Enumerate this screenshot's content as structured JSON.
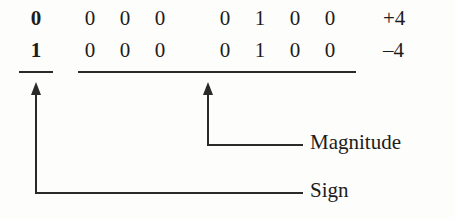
{
  "figure": {
    "rows": [
      {
        "name": "positive-row",
        "sign_bit": "0",
        "magnitude_bits": [
          "0",
          "0",
          "0",
          "0",
          "1",
          "0",
          "0"
        ],
        "value": "+4"
      },
      {
        "name": "negative-row",
        "sign_bit": "1",
        "magnitude_bits": [
          "0",
          "0",
          "0",
          "0",
          "1",
          "0",
          "0"
        ],
        "value": "–4"
      }
    ],
    "annotations": [
      {
        "name": "magnitude-annotation",
        "label": "Magnitude"
      },
      {
        "name": "sign-annotation",
        "label": "Sign"
      }
    ],
    "colors": {
      "ink": "#1c1c1c",
      "rule": "#2a2a2a",
      "background": "#fdfdfb"
    }
  }
}
